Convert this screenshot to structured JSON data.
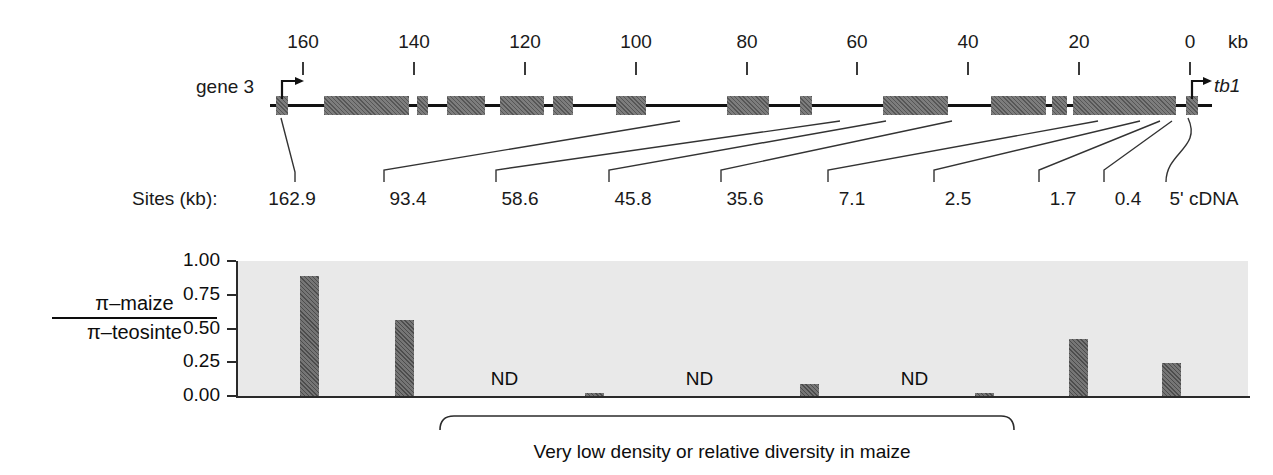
{
  "figure": {
    "gene_label": "gene 3",
    "right_gene_label": "tb1",
    "kb_unit": "kb",
    "sites_title": "Sites (kb):",
    "bracket_caption": "Very low density or relative diversity in maize"
  },
  "axis": {
    "unit": "kb",
    "direction": "right-to-left",
    "ticks": [
      {
        "label": "160",
        "kb": 160,
        "x": 303
      },
      {
        "label": "140",
        "kb": 140,
        "x": 414
      },
      {
        "label": "120",
        "kb": 120,
        "x": 525
      },
      {
        "label": "100",
        "kb": 100,
        "x": 636
      },
      {
        "label": "80",
        "kb": 80,
        "x": 747
      },
      {
        "label": "60",
        "kb": 60,
        "x": 857
      },
      {
        "label": "40",
        "kb": 40,
        "x": 968
      },
      {
        "label": "20",
        "kb": 20,
        "x": 1079
      },
      {
        "label": "0",
        "kb": 0,
        "x": 1190
      }
    ]
  },
  "gene_model": {
    "backbone": {
      "x": 270,
      "width": 942
    },
    "exons": [
      {
        "x": 276,
        "width": 12
      },
      {
        "x": 324,
        "width": 85
      },
      {
        "x": 417,
        "width": 11
      },
      {
        "x": 447,
        "width": 38
      },
      {
        "x": 500,
        "width": 44
      },
      {
        "x": 553,
        "width": 20
      },
      {
        "x": 616,
        "width": 30
      },
      {
        "x": 727,
        "width": 42
      },
      {
        "x": 800,
        "width": 12
      },
      {
        "x": 883,
        "width": 65
      },
      {
        "x": 991,
        "width": 55
      },
      {
        "x": 1052,
        "width": 15
      },
      {
        "x": 1073,
        "width": 103
      },
      {
        "x": 1186,
        "width": 12
      }
    ]
  },
  "sites": [
    {
      "label": "162.9",
      "label_x": 292,
      "anchor_x": 281
    },
    {
      "label": "93.4",
      "label_x": 408,
      "anchor_x": 680
    },
    {
      "label": "58.6",
      "label_x": 520,
      "anchor_x": 840
    },
    {
      "label": "45.8",
      "label_x": 633,
      "anchor_x": 886
    },
    {
      "label": "35.6",
      "label_x": 745,
      "anchor_x": 952
    },
    {
      "label": "7.1",
      "label_x": 852,
      "anchor_x": 1098
    },
    {
      "label": "2.5",
      "label_x": 958,
      "anchor_x": 1140
    },
    {
      "label": "1.7",
      "label_x": 1063,
      "anchor_x": 1160
    },
    {
      "label": "0.4",
      "label_x": 1128,
      "anchor_x": 1172
    },
    {
      "label": "5' cDNA",
      "label_x": 1204,
      "anchor_x": 1188
    }
  ],
  "chart_data": {
    "type": "bar",
    "title": "",
    "xlabel": "",
    "ylabel": "π–maize / π–teosinte",
    "ylabel_numerator": "π–maize",
    "ylabel_denominator": "π–teosinte",
    "ylim": [
      0.0,
      1.0
    ],
    "yticks": [
      "0.00",
      "0.25",
      "0.50",
      "0.75",
      "1.00"
    ],
    "ytick_values": [
      0.0,
      0.25,
      0.5,
      0.75,
      1.0
    ],
    "grid": false,
    "legend": "none",
    "plot_background": "#e9e9e9",
    "bar_color": "#666666",
    "categories": [
      "162.9",
      "93.4",
      "58.6",
      "45.8",
      "35.6",
      "7.1",
      "2.5",
      "1.7",
      "0.4",
      "5' cDNA"
    ],
    "values": [
      0.89,
      0.56,
      null,
      0.02,
      null,
      0.09,
      null,
      0.02,
      0.42,
      0.245
    ],
    "missing_label": "ND",
    "bars": [
      {
        "category": "162.9",
        "value": 0.89,
        "x": 300,
        "width": 19,
        "nd": false
      },
      {
        "category": "93.4",
        "value": 0.56,
        "x": 395,
        "width": 19,
        "nd": false
      },
      {
        "category": "58.6",
        "value": null,
        "x": 495,
        "width": 19,
        "nd": true
      },
      {
        "category": "45.8",
        "value": 0.02,
        "x": 585,
        "width": 19,
        "nd": false
      },
      {
        "category": "35.6",
        "value": null,
        "x": 690,
        "width": 19,
        "nd": true
      },
      {
        "category": "7.1",
        "value": 0.09,
        "x": 800,
        "width": 19,
        "nd": false
      },
      {
        "category": "2.5",
        "value": null,
        "x": 905,
        "width": 19,
        "nd": true
      },
      {
        "category": "1.7",
        "value": 0.02,
        "x": 975,
        "width": 19,
        "nd": false
      },
      {
        "category": "0.4",
        "value": 0.42,
        "x": 1069,
        "width": 19,
        "nd": false
      },
      {
        "category": "5' cDNA",
        "value": 0.245,
        "x": 1162,
        "width": 19,
        "nd": false
      }
    ]
  },
  "colors": {
    "exon_fill": "#6e6e6e",
    "bar_fill": "#666666",
    "plot_bg": "#e9e9e9",
    "ink": "#111111"
  }
}
